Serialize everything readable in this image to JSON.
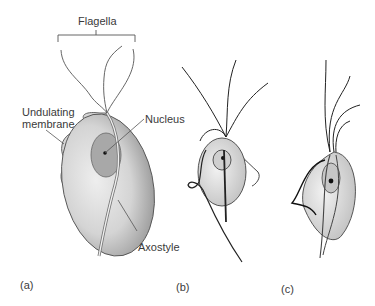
{
  "figure": {
    "panels": [
      {
        "id": "a",
        "label": "(a)"
      },
      {
        "id": "b",
        "label": "(b)"
      },
      {
        "id": "c",
        "label": "(c)"
      }
    ],
    "labels": {
      "flagella": "Flagella",
      "undulating_membrane_line1": "Undulating",
      "undulating_membrane_line2": "membrane",
      "nucleus": "Nucleus",
      "axostyle": "Axostyle"
    },
    "colors": {
      "background": "#ffffff",
      "outline": "#3a3a3a",
      "body_light": "#e6e6e6",
      "body_shade": "#9a9a9a",
      "nucleus_fill": "#a8a8a8"
    }
  }
}
